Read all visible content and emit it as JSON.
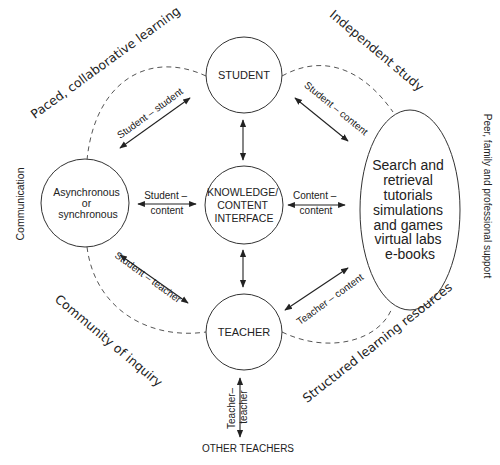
{
  "nodes": {
    "student": {
      "label": "STUDENT"
    },
    "knowledge": {
      "lines": [
        "KNOWLEDGE/",
        "CONTENT",
        "INTERFACE"
      ]
    },
    "teacher": {
      "label": "TEACHER"
    },
    "communication_mode": {
      "lines": [
        "Asynchronous",
        "or",
        "synchronous"
      ]
    },
    "resources": {
      "lines": [
        "Search and",
        "retrieval",
        "tutorials",
        "simulations",
        "and games",
        "virtual labs",
        "e-books"
      ]
    },
    "other_teachers": {
      "label": "OTHER TEACHERS"
    }
  },
  "edges": {
    "student_student": "Student – student",
    "student_content_top": "Student – content",
    "student_content_left": [
      "Student –",
      "content"
    ],
    "content_content": [
      "Content –",
      "content"
    ],
    "student_teacher": "Student – teacher",
    "teacher_content": "Teacher – content",
    "teacher_teacher": [
      "Teacher–",
      "teacher"
    ]
  },
  "region_labels": {
    "paced": "Paced, collaborative learning",
    "independent": "Independent study",
    "community": "Community of inquiry",
    "structured": "Structured learning resources",
    "communication": "Communication",
    "peer_support": "Peer, family and professional support"
  },
  "colors": {
    "stroke": "#333333",
    "dashed": "#555555",
    "text": "#222222",
    "background": "#ffffff"
  }
}
